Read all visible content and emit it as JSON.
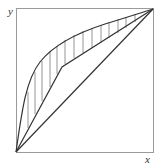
{
  "figure": {
    "type": "diagram",
    "axes": {
      "x_label": "x",
      "y_label": "y"
    },
    "colors": {
      "box": "#9a9a9a",
      "curve": "#333333",
      "hatch": "#8a8a8a",
      "label": "#333333",
      "background": "#ffffff"
    }
  }
}
